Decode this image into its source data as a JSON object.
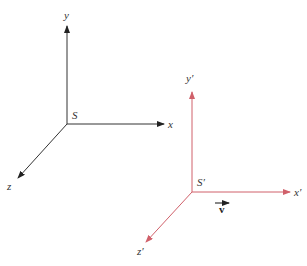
{
  "diagram": {
    "frame_S": {
      "color": "#222222",
      "origin_label": "S",
      "axes": [
        {
          "name": "x",
          "label": "x"
        },
        {
          "name": "y",
          "label": "y"
        },
        {
          "name": "z",
          "label": "z"
        }
      ]
    },
    "frame_S_prime": {
      "color": "#d0606a",
      "origin_label": "S′",
      "axes": [
        {
          "name": "x",
          "label": "x′"
        },
        {
          "name": "y",
          "label": "y′"
        },
        {
          "name": "z",
          "label": "z′"
        }
      ]
    },
    "velocity": {
      "label": "v",
      "color": "#111111"
    }
  }
}
